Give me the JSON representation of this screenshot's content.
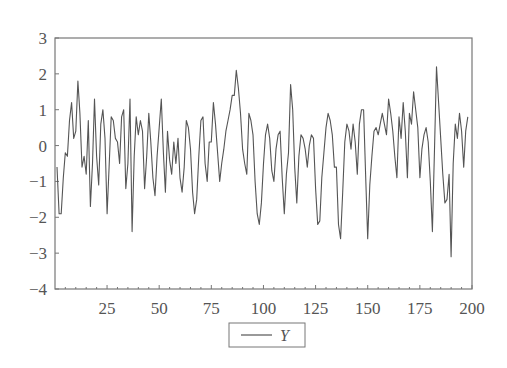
{
  "chart_data": {
    "type": "line",
    "title": "",
    "xlabel": "",
    "ylabel": "",
    "xlim": [
      1,
      200
    ],
    "ylim": [
      -4,
      3
    ],
    "grid": false,
    "legend_position": "bottom-center",
    "y_ticks": [
      "3",
      "2",
      "1",
      "0",
      "−1",
      "−2",
      "−3",
      "−4"
    ],
    "y_tick_values": [
      3,
      2,
      1,
      0,
      -1,
      -2,
      -3,
      -4
    ],
    "x_ticks": [
      "25",
      "50",
      "75",
      "100",
      "125",
      "150",
      "175",
      "200"
    ],
    "x_tick_values": [
      25,
      50,
      75,
      100,
      125,
      150,
      175,
      200
    ],
    "series": [
      {
        "name": "Y",
        "color": "#555555",
        "x_start": 1,
        "values": [
          -0.6,
          -1.9,
          -1.9,
          -0.9,
          -0.2,
          -0.3,
          0.7,
          1.2,
          0.2,
          0.4,
          1.8,
          0.9,
          -0.6,
          -0.3,
          -0.8,
          0.7,
          -1.7,
          -0.5,
          1.3,
          -0.3,
          -1.1,
          0.6,
          1.0,
          0.2,
          -1.9,
          -0.6,
          0.8,
          0.7,
          0.2,
          0.1,
          -0.5,
          0.8,
          1.0,
          -1.2,
          -0.5,
          1.3,
          -2.4,
          -0.3,
          0.8,
          0.3,
          0.7,
          0.4,
          -1.2,
          -0.3,
          0.9,
          0.1,
          -0.9,
          -1.4,
          -0.3,
          0.5,
          1.3,
          -0.2,
          -1.3,
          0.4,
          -0.4,
          -0.8,
          0.1,
          -0.5,
          0.2,
          -0.9,
          -1.3,
          -0.6,
          0.7,
          0.5,
          -0.1,
          -1.3,
          -1.9,
          -1.5,
          -0.3,
          0.7,
          0.8,
          -0.5,
          -1.0,
          0.1,
          0.1,
          1.2,
          0.6,
          -0.2,
          -1.0,
          -0.5,
          -0.1,
          0.4,
          0.7,
          1.0,
          1.4,
          1.4,
          2.1,
          1.6,
          0.9,
          -0.1,
          -0.5,
          -0.8,
          0.9,
          0.7,
          0.3,
          -1.0,
          -1.9,
          -2.2,
          -1.6,
          -0.5,
          0.3,
          0.6,
          0.2,
          -0.7,
          -1.0,
          -0.1,
          0.3,
          0.4,
          -0.9,
          -1.9,
          -0.8,
          -0.2,
          1.7,
          1.0,
          -0.6,
          -1.6,
          -0.3,
          0.3,
          0.2,
          -0.1,
          -0.6,
          0.0,
          0.3,
          0.2,
          -1.2,
          -2.2,
          -2.1,
          -0.9,
          -0.2,
          0.5,
          0.9,
          0.7,
          0.3,
          -0.6,
          -0.6,
          -2.2,
          -2.6,
          -1.3,
          0.1,
          0.6,
          0.4,
          -0.1,
          0.6,
          0.1,
          -0.8,
          0.6,
          1.0,
          1.0,
          -0.8,
          -2.6,
          -1.1,
          -0.3,
          0.4,
          0.5,
          0.3,
          0.6,
          0.9,
          0.6,
          0.3,
          1.3,
          0.9,
          0.4,
          -0.3,
          -0.9,
          0.8,
          0.2,
          1.2,
          0.4,
          -0.9,
          0.9,
          0.6,
          1.5,
          1.0,
          0.5,
          -0.9,
          -0.1,
          0.3,
          0.5,
          0.1,
          -1.0,
          -2.4,
          -0.1,
          2.2,
          1.2,
          0.2,
          -0.8,
          -1.6,
          -1.5,
          -0.8,
          -3.1,
          -0.5,
          0.6,
          0.2,
          0.9,
          0.4,
          -0.6,
          0.4,
          0.8
        ]
      }
    ],
    "legend": [
      {
        "label": "Y",
        "line_color": "#555555"
      }
    ]
  },
  "legend": {
    "label": "Y"
  }
}
